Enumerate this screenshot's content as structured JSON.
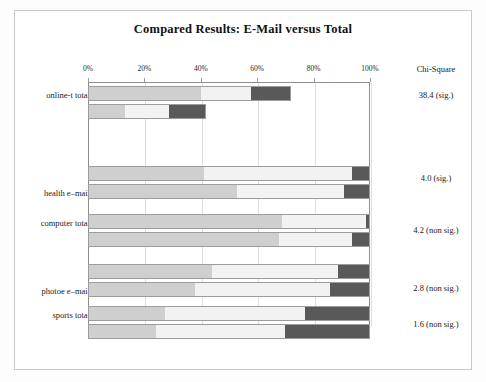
{
  "figure": {
    "title": "Compared Results: E-Mail versus Total",
    "chi_header": "Chi-Square"
  },
  "colors": {
    "segment_low": "#cfcfcf",
    "segment_mid": "#f2f2f2",
    "segment_high": "#595959",
    "frame": "#8d8d8d",
    "grid": "#dedede",
    "page_border": "#c9c9c9"
  },
  "chart_data": {
    "type": "bar",
    "orientation": "horizontal",
    "stacked": true,
    "title": "Compared Results: E-Mail versus Total",
    "xlabel": "",
    "ylabel": "",
    "xlim": [
      0,
      100
    ],
    "xticks": [
      0,
      20,
      40,
      60,
      80,
      100
    ],
    "xtick_labels": [
      "0%",
      "20%",
      "40%",
      "60%",
      "80%",
      "100%"
    ],
    "grid": true,
    "legend": "none",
    "categories": [
      "online-t total",
      "health e–mail",
      "computer total",
      "photoe e–mail",
      "sports total"
    ],
    "series": [
      {
        "name": "segment-1",
        "color": "#cfcfcf"
      },
      {
        "name": "segment-2",
        "color": "#f2f2f2"
      },
      {
        "name": "segment-3",
        "color": "#595959"
      }
    ],
    "groups": [
      {
        "category": "online-t total",
        "chi_square": "38.4 (sig.)",
        "bars": [
          {
            "name": "total",
            "values": [
              40,
              18,
              14
            ]
          },
          {
            "name": "e-mail",
            "values": [
              13,
              16,
              13
            ]
          }
        ]
      },
      {
        "category": "health e–mail",
        "chi_square": "4.0 (sig.)",
        "bars": [
          {
            "name": "total",
            "values": [
              41,
              53,
              6
            ]
          },
          {
            "name": "e-mail",
            "values": [
              53,
              38,
              9
            ]
          }
        ]
      },
      {
        "category": "computer total",
        "chi_square": "4.2 (non sig.)",
        "bars": [
          {
            "name": "total",
            "values": [
              69,
              30,
              1
            ]
          },
          {
            "name": "e-mail",
            "values": [
              68,
              26,
              6
            ]
          }
        ]
      },
      {
        "category": "photoe e–mail",
        "chi_square": "2.8 (non sig.)",
        "bars": [
          {
            "name": "total",
            "values": [
              44,
              45,
              11
            ]
          },
          {
            "name": "e-mail",
            "values": [
              38,
              48,
              14
            ]
          }
        ]
      },
      {
        "category": "sports total",
        "chi_square": "1.6 (non sig.)",
        "bars": [
          {
            "name": "total",
            "values": [
              27,
              50,
              23
            ]
          },
          {
            "name": "e-mail",
            "values": [
              24,
              46,
              30
            ]
          }
        ]
      }
    ]
  },
  "layout": {
    "plot_left": 88,
    "plot_top": 82,
    "plot_width": 282,
    "plot_height": 246,
    "row_tops": [
      [
        86,
        104
      ],
      [
        166,
        184
      ],
      [
        214,
        232
      ],
      [
        264,
        282
      ],
      [
        306,
        324
      ]
    ],
    "label_tops": [
      90,
      188,
      218,
      286,
      310
    ],
    "chi_tops": [
      90,
      173,
      225,
      283,
      319
    ]
  }
}
